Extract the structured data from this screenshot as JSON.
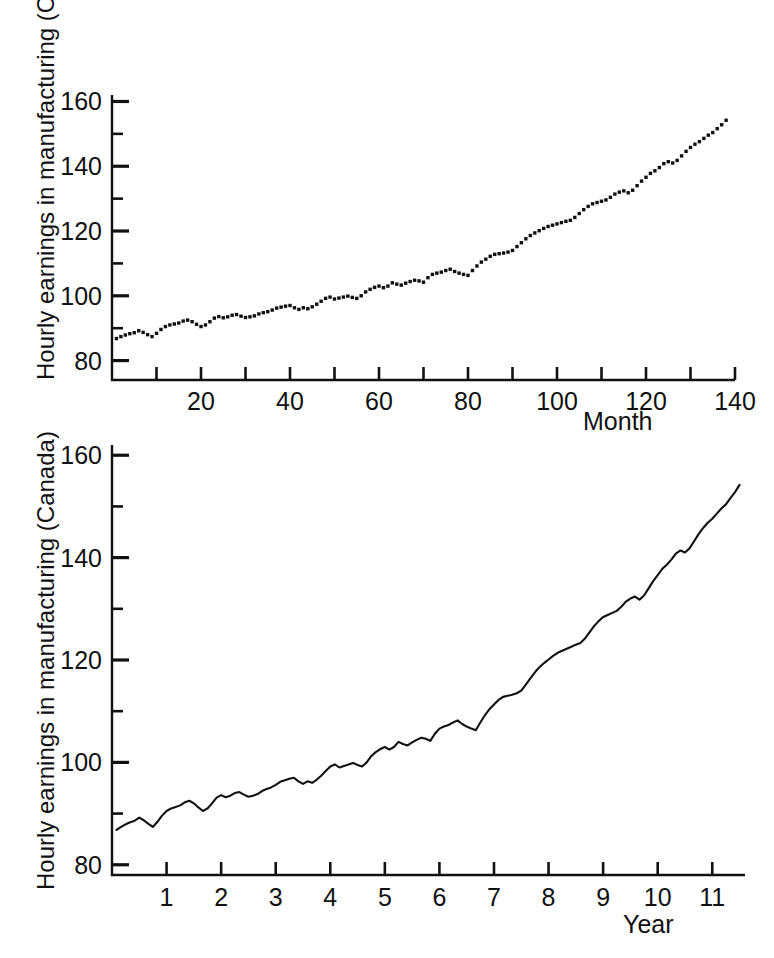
{
  "figure": {
    "background": "#ffffff",
    "ink_color": "#111111"
  },
  "chart_data": [
    {
      "id": "top-panel",
      "type": "scatter",
      "title": "",
      "subtitle": "",
      "xlabel": "Month",
      "ylabel": "Hourly earnings in manufacturing (Canada)",
      "xlim": [
        0,
        140
      ],
      "ylim": [
        74,
        162
      ],
      "y_major_ticks": [
        80,
        100,
        120,
        140,
        160
      ],
      "y_minor_ticks": [
        90,
        110,
        130,
        150
      ],
      "y_ticklabels": [
        "80",
        "100",
        "120",
        "140",
        "160"
      ],
      "x_major_ticks": [
        20,
        40,
        60,
        80,
        100,
        120,
        140
      ],
      "x_minor_ticks": [
        10,
        30,
        50,
        70,
        90,
        110,
        130
      ],
      "x_ticklabels": [
        "20",
        "40",
        "60",
        "80",
        "100",
        "120",
        "140"
      ],
      "grid": false,
      "legend": "none",
      "marker": "square-dot",
      "x": [
        1,
        2,
        3,
        4,
        5,
        6,
        7,
        8,
        9,
        10,
        11,
        12,
        13,
        14,
        15,
        16,
        17,
        18,
        19,
        20,
        21,
        22,
        23,
        24,
        25,
        26,
        27,
        28,
        29,
        30,
        31,
        32,
        33,
        34,
        35,
        36,
        37,
        38,
        39,
        40,
        41,
        42,
        43,
        44,
        45,
        46,
        47,
        48,
        49,
        50,
        51,
        52,
        53,
        54,
        55,
        56,
        57,
        58,
        59,
        60,
        61,
        62,
        63,
        64,
        65,
        66,
        67,
        68,
        69,
        70,
        71,
        72,
        73,
        74,
        75,
        76,
        77,
        78,
        79,
        80,
        81,
        82,
        83,
        84,
        85,
        86,
        87,
        88,
        89,
        90,
        91,
        92,
        93,
        94,
        95,
        96,
        97,
        98,
        99,
        100,
        101,
        102,
        103,
        104,
        105,
        106,
        107,
        108,
        109,
        110,
        111,
        112,
        113,
        114,
        115,
        116,
        117,
        118,
        119,
        120,
        121,
        122,
        123,
        124,
        125,
        126,
        127,
        128,
        129,
        130,
        131,
        132,
        133,
        134,
        135,
        136,
        137,
        138
      ],
      "values": [
        86.8,
        87.4,
        87.9,
        88.3,
        88.6,
        89.2,
        88.7,
        88.0,
        87.4,
        88.4,
        89.6,
        90.5,
        91.0,
        91.3,
        91.6,
        92.2,
        92.5,
        92.0,
        91.2,
        90.5,
        91.0,
        92.0,
        93.1,
        93.6,
        93.2,
        93.5,
        94.0,
        94.2,
        93.7,
        93.3,
        93.5,
        93.8,
        94.4,
        94.8,
        95.1,
        95.6,
        96.2,
        96.5,
        96.8,
        97.0,
        96.3,
        95.8,
        96.3,
        96.0,
        96.6,
        97.4,
        98.3,
        99.2,
        99.6,
        99.0,
        99.3,
        99.6,
        99.9,
        99.5,
        99.2,
        100.0,
        101.2,
        102.0,
        102.6,
        103.0,
        102.5,
        103.0,
        104.0,
        103.6,
        103.3,
        103.9,
        104.4,
        104.8,
        104.6,
        104.2,
        105.6,
        106.6,
        107.0,
        107.3,
        107.8,
        108.2,
        107.5,
        107.0,
        106.6,
        106.3,
        107.8,
        109.2,
        110.4,
        111.3,
        112.2,
        112.8,
        113.0,
        113.2,
        113.5,
        114.0,
        115.2,
        116.4,
        117.6,
        118.6,
        119.4,
        120.1,
        120.8,
        121.4,
        121.8,
        122.2,
        122.6,
        123.0,
        123.3,
        124.2,
        125.4,
        126.6,
        127.6,
        128.4,
        128.8,
        129.2,
        129.6,
        130.4,
        131.4,
        132.0,
        132.4,
        131.8,
        132.6,
        134.0,
        135.4,
        136.6,
        137.8,
        138.6,
        139.6,
        140.8,
        141.4,
        141.0,
        141.8,
        143.2,
        144.6,
        145.8,
        146.8,
        147.6,
        148.6,
        149.6,
        150.4,
        151.6,
        152.8,
        154.2
      ]
    },
    {
      "id": "bottom-panel",
      "type": "line",
      "title": "",
      "subtitle": "",
      "xlabel": "Year",
      "ylabel": "Hourly earnings in manufacturing (Canada)",
      "xlim": [
        0,
        11.6
      ],
      "ylim": [
        78,
        162
      ],
      "y_major_ticks": [
        80,
        100,
        120,
        140,
        160
      ],
      "y_minor_ticks": [
        90,
        110,
        130,
        150
      ],
      "y_ticklabels": [
        "80",
        "100",
        "120",
        "140",
        "160"
      ],
      "x_major_ticks": [
        1,
        2,
        3,
        4,
        5,
        6,
        7,
        8,
        9,
        10,
        11
      ],
      "x_ticklabels": [
        "1",
        "2",
        "3",
        "4",
        "5",
        "6",
        "7",
        "8",
        "9",
        "10",
        "11"
      ],
      "grid": false,
      "legend": "none",
      "x": [
        0.083,
        0.167,
        0.25,
        0.333,
        0.417,
        0.5,
        0.583,
        0.667,
        0.75,
        0.833,
        0.917,
        1.0,
        1.083,
        1.167,
        1.25,
        1.333,
        1.417,
        1.5,
        1.583,
        1.667,
        1.75,
        1.833,
        1.917,
        2.0,
        2.083,
        2.167,
        2.25,
        2.333,
        2.417,
        2.5,
        2.583,
        2.667,
        2.75,
        2.833,
        2.917,
        3.0,
        3.083,
        3.167,
        3.25,
        3.333,
        3.417,
        3.5,
        3.583,
        3.667,
        3.75,
        3.833,
        3.917,
        4.0,
        4.083,
        4.167,
        4.25,
        4.333,
        4.417,
        4.5,
        4.583,
        4.667,
        4.75,
        4.833,
        4.917,
        5.0,
        5.083,
        5.167,
        5.25,
        5.333,
        5.417,
        5.5,
        5.583,
        5.667,
        5.75,
        5.833,
        5.917,
        6.0,
        6.083,
        6.167,
        6.25,
        6.333,
        6.417,
        6.5,
        6.583,
        6.667,
        6.75,
        6.833,
        6.917,
        7.0,
        7.083,
        7.167,
        7.25,
        7.333,
        7.417,
        7.5,
        7.583,
        7.667,
        7.75,
        7.833,
        7.917,
        8.0,
        8.083,
        8.167,
        8.25,
        8.333,
        8.417,
        8.5,
        8.583,
        8.667,
        8.75,
        8.833,
        8.917,
        9.0,
        9.083,
        9.167,
        9.25,
        9.333,
        9.417,
        9.5,
        9.583,
        9.667,
        9.75,
        9.833,
        9.917,
        10.0,
        10.083,
        10.167,
        10.25,
        10.333,
        10.417,
        10.5,
        10.583,
        10.667,
        10.75,
        10.833,
        10.917,
        11.0,
        11.083,
        11.167,
        11.25,
        11.333,
        11.417,
        11.5
      ],
      "values": [
        86.8,
        87.4,
        87.9,
        88.3,
        88.6,
        89.2,
        88.7,
        88.0,
        87.4,
        88.4,
        89.6,
        90.5,
        91.0,
        91.3,
        91.6,
        92.2,
        92.5,
        92.0,
        91.2,
        90.5,
        91.0,
        92.0,
        93.1,
        93.6,
        93.2,
        93.5,
        94.0,
        94.2,
        93.7,
        93.3,
        93.5,
        93.8,
        94.4,
        94.8,
        95.1,
        95.6,
        96.2,
        96.5,
        96.8,
        97.0,
        96.3,
        95.8,
        96.3,
        96.0,
        96.6,
        97.4,
        98.3,
        99.2,
        99.6,
        99.0,
        99.3,
        99.6,
        99.9,
        99.5,
        99.2,
        100.0,
        101.2,
        102.0,
        102.6,
        103.0,
        102.5,
        103.0,
        104.0,
        103.6,
        103.3,
        103.9,
        104.4,
        104.8,
        104.6,
        104.2,
        105.6,
        106.6,
        107.0,
        107.3,
        107.8,
        108.2,
        107.5,
        107.0,
        106.6,
        106.3,
        107.8,
        109.2,
        110.4,
        111.3,
        112.2,
        112.8,
        113.0,
        113.2,
        113.5,
        114.0,
        115.2,
        116.4,
        117.6,
        118.6,
        119.4,
        120.1,
        120.8,
        121.4,
        121.8,
        122.2,
        122.6,
        123.0,
        123.3,
        124.2,
        125.4,
        126.6,
        127.6,
        128.4,
        128.8,
        129.2,
        129.6,
        130.4,
        131.4,
        132.0,
        132.4,
        131.8,
        132.6,
        134.0,
        135.4,
        136.6,
        137.8,
        138.6,
        139.6,
        140.8,
        141.4,
        141.0,
        141.8,
        143.2,
        144.6,
        145.8,
        146.8,
        147.6,
        148.6,
        149.6,
        150.4,
        151.6,
        152.8,
        154.2
      ]
    }
  ]
}
